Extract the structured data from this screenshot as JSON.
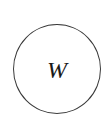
{
  "diagram": {
    "nodes": [
      {
        "id": "W",
        "label": "W",
        "shape": "circle",
        "stroke_color": "#3a3a3a",
        "fill_color": "#ffffff"
      }
    ]
  }
}
